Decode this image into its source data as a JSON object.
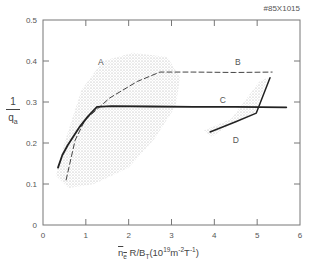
{
  "figure": {
    "shot_id": "#85X1015",
    "ylabel_num": "1",
    "ylabel_den": "q",
    "ylabel_den_sub": "a",
    "xlabel_n": "n",
    "xlabel_n_sub": "e",
    "xlabel_rest": " R/B",
    "xlabel_bt_sub": "T",
    "xlabel_units_open": "(10",
    "xlabel_units_sup1": "19",
    "xlabel_units_m": "m",
    "xlabel_units_sup2": "-2",
    "xlabel_units_T": "T",
    "xlabel_units_sup3": "-1",
    "xlabel_units_close": ")"
  },
  "chart_data": {
    "type": "line",
    "title": "",
    "annotation": "#85X1015",
    "xlabel": "n̄e R/BT (10^19 m^-2 T^-1)",
    "ylabel": "1/qa",
    "xlim": [
      0,
      6
    ],
    "ylim": [
      0,
      0.5
    ],
    "x_ticks": [
      "0",
      "1",
      "2",
      "3",
      "4",
      "5",
      "6"
    ],
    "y_ticks": [
      "0",
      "0.1",
      "0.2",
      "0.3",
      "0.4",
      "0.5"
    ],
    "grid": false,
    "legend": "inline labels A, B, C, D",
    "series": [
      {
        "name": "A",
        "style": "shaded region (scatter cloud)",
        "polygon": [
          [
            0.3,
            0.12
          ],
          [
            0.5,
            0.2
          ],
          [
            0.9,
            0.33
          ],
          [
            1.4,
            0.4
          ],
          [
            2.1,
            0.42
          ],
          [
            2.9,
            0.41
          ],
          [
            3.2,
            0.36
          ],
          [
            3.1,
            0.29
          ],
          [
            2.6,
            0.21
          ],
          [
            2.0,
            0.14
          ],
          [
            1.2,
            0.1
          ],
          [
            0.6,
            0.09
          ]
        ]
      },
      {
        "name": "B",
        "style": "dashed",
        "x": [
          0.54,
          0.75,
          0.98,
          1.56,
          2.2,
          2.73,
          3.5,
          4.5,
          5.35
        ],
        "y": [
          0.11,
          0.207,
          0.256,
          0.31,
          0.35,
          0.373,
          0.373,
          0.372,
          0.373
        ]
      },
      {
        "name": "C",
        "style": "solid thick",
        "x": [
          0.35,
          0.45,
          0.58,
          0.86,
          1.05,
          1.26,
          1.6,
          2.5,
          3.5,
          4.5,
          5.68
        ],
        "y": [
          0.14,
          0.17,
          0.195,
          0.24,
          0.265,
          0.288,
          0.29,
          0.289,
          0.288,
          0.288,
          0.287
        ]
      },
      {
        "name": "D",
        "style": "solid, with shaded band",
        "x": [
          3.9,
          4.5,
          4.98,
          5.3
        ],
        "y": [
          0.227,
          0.252,
          0.273,
          0.359
        ]
      }
    ],
    "labels": [
      {
        "text": "A",
        "x": 1.35,
        "y": 0.39
      },
      {
        "text": "B",
        "x": 4.55,
        "y": 0.39
      },
      {
        "text": "C",
        "x": 4.2,
        "y": 0.297
      },
      {
        "text": "D",
        "x": 4.5,
        "y": 0.2
      }
    ]
  }
}
